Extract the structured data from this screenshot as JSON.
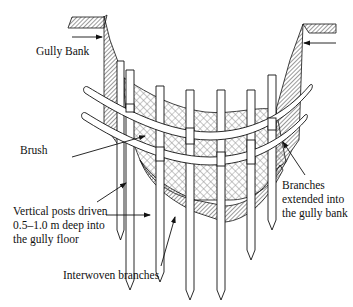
{
  "diagram": {
    "type": "cross-section illustration",
    "labels": {
      "gully_bank": "Gully Bank",
      "brush": "Brush",
      "vertical_posts_line1": "Vertical posts driven",
      "vertical_posts_line2": "0.5–1.0 m deep into",
      "vertical_posts_line3": "the gully floor",
      "branches_ext_line1": "Branches",
      "branches_ext_line2": "extended into",
      "branches_ext_line3": "the gully bank",
      "interwoven_branches": "Interwoven branches"
    },
    "components": {
      "vertical_posts_count": 7,
      "horizontal_branches_count": 2,
      "fill_patterns": [
        "dense-hatch (gully bank / soil)",
        "cross-hatch (brush)"
      ]
    },
    "colors": {
      "line": "#1a1a1a",
      "background": "#ffffff",
      "hatch_dark": "#555555",
      "hatch_light": "#888888"
    }
  }
}
